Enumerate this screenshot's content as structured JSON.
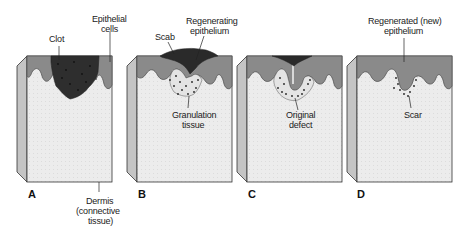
{
  "figure": {
    "colors": {
      "epithelium": "#8a8a8a",
      "epithelium_edge": "#555555",
      "dermis": "#ececec",
      "side_face": "#c4c4c4",
      "clot": "#2e2e2e",
      "scab": "#2a2a2a",
      "outline": "#333333",
      "granulation_dots": "#222222",
      "text": "#222222"
    },
    "panels": [
      {
        "letter": "A",
        "labels": {
          "clot": "Clot",
          "epithelial_1": "Epithelial",
          "epithelial_2": "cells",
          "dermis_1": "Dermis",
          "dermis_2": "(connective",
          "dermis_3": "tissue)"
        }
      },
      {
        "letter": "B",
        "labels": {
          "scab": "Scab",
          "regen_1": "Regenerating",
          "regen_2": "epithelium",
          "gran_1": "Granulation",
          "gran_2": "tissue"
        }
      },
      {
        "letter": "C",
        "labels": {
          "orig_1": "Original",
          "orig_2": "defect"
        }
      },
      {
        "letter": "D",
        "labels": {
          "regend_1": "Regenerated (new)",
          "regend_2": "epithelium",
          "scar": "Scar"
        }
      }
    ]
  }
}
